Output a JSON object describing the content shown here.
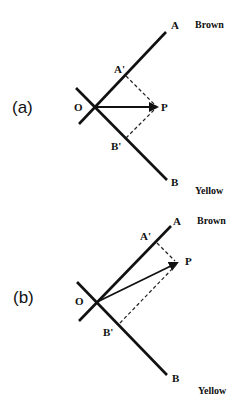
{
  "panels": [
    {
      "id": "a",
      "label": "(a)",
      "points": {
        "O": "O",
        "A": "A",
        "B": "B",
        "A_prime": "A'",
        "B_prime": "B'",
        "P": "P"
      },
      "axis_a_name": "Brown",
      "axis_b_name": "Yellow",
      "description": "Vector OP lies midway between axes OA and OB; projections A' and B' equal"
    },
    {
      "id": "b",
      "label": "(b)",
      "points": {
        "O": "O",
        "A": "A",
        "B": "B",
        "A_prime": "A'",
        "B_prime": "B'",
        "P": "P"
      },
      "axis_a_name": "Brown",
      "axis_b_name": "Yellow",
      "description": "Vector OP leans toward axis OA; projection A' larger than B'"
    }
  ],
  "colors": {
    "ink": "#111111",
    "background": "#ffffff"
  }
}
